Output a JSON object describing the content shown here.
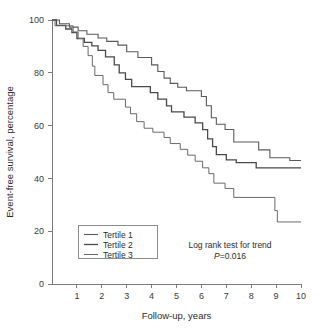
{
  "chart_data": {
    "type": "line",
    "subtype": "kaplan-meier-step",
    "title": "",
    "xlabel": "Follow-up, years",
    "ylabel": "Event-free survival, percentage",
    "xlim": [
      0,
      10
    ],
    "ylim": [
      0,
      100
    ],
    "xticks": [
      1,
      2,
      3,
      4,
      5,
      6,
      7,
      8,
      9,
      10
    ],
    "xtick_labels": [
      "1",
      "2",
      "3",
      "4",
      "5",
      "6",
      "7",
      "8",
      "9",
      "10"
    ],
    "yticks": [
      0,
      20,
      40,
      60,
      80,
      100
    ],
    "ytick_labels": [
      "0",
      "20",
      "40",
      "60",
      "80",
      "100"
    ],
    "grid": false,
    "legend_position": "lower-left",
    "annotations": [
      {
        "name": "log-rank-line1",
        "text": "Log rank test for trend"
      },
      {
        "name": "log-rank-line2",
        "text_prefix": "P",
        "text_suffix": "=0.016",
        "text": "P=0.016"
      }
    ],
    "series": [
      {
        "name": "Tertile 1",
        "color": "#5a5a5a",
        "width": 1.1,
        "final_value": 46.8,
        "points": [
          [
            0.0,
            100.0
          ],
          [
            0.3,
            100.0
          ],
          [
            0.3,
            98.6
          ],
          [
            0.7,
            98.6
          ],
          [
            0.7,
            97.3
          ],
          [
            1.05,
            97.3
          ],
          [
            1.05,
            95.9
          ],
          [
            1.4,
            95.9
          ],
          [
            1.4,
            94.6
          ],
          [
            1.85,
            94.6
          ],
          [
            1.85,
            93.2
          ],
          [
            2.2,
            93.2
          ],
          [
            2.2,
            91.9
          ],
          [
            2.65,
            91.9
          ],
          [
            2.65,
            90.5
          ],
          [
            3.0,
            90.5
          ],
          [
            3.0,
            88.0
          ],
          [
            3.45,
            88.0
          ],
          [
            3.45,
            85.8
          ],
          [
            4.0,
            85.8
          ],
          [
            4.0,
            83.0
          ],
          [
            4.25,
            83.0
          ],
          [
            4.25,
            80.5
          ],
          [
            4.5,
            80.5
          ],
          [
            4.5,
            78.0
          ],
          [
            4.75,
            78.0
          ],
          [
            4.75,
            76.0
          ],
          [
            5.05,
            76.0
          ],
          [
            5.05,
            74.5
          ],
          [
            5.4,
            74.5
          ],
          [
            5.4,
            73.2
          ],
          [
            6.0,
            73.2
          ],
          [
            6.0,
            71.0
          ],
          [
            6.2,
            71.0
          ],
          [
            6.2,
            67.5
          ],
          [
            6.4,
            67.5
          ],
          [
            6.4,
            63.0
          ],
          [
            6.6,
            63.0
          ],
          [
            6.6,
            60.5
          ],
          [
            6.95,
            60.5
          ],
          [
            6.95,
            58.5
          ],
          [
            7.3,
            58.5
          ],
          [
            7.3,
            53.8
          ],
          [
            8.3,
            53.8
          ],
          [
            8.3,
            50.8
          ],
          [
            8.75,
            50.8
          ],
          [
            8.75,
            47.8
          ],
          [
            9.55,
            47.8
          ],
          [
            9.55,
            46.8
          ],
          [
            10.0,
            46.8
          ]
        ]
      },
      {
        "name": "Tertile 2",
        "color": "#4a4a4a",
        "width": 1.3,
        "final_value": 44.0,
        "points": [
          [
            0.0,
            100.0
          ],
          [
            0.18,
            100.0
          ],
          [
            0.18,
            98.0
          ],
          [
            0.55,
            98.0
          ],
          [
            0.55,
            96.6
          ],
          [
            0.8,
            96.6
          ],
          [
            0.8,
            95.2
          ],
          [
            1.0,
            95.2
          ],
          [
            1.0,
            93.0
          ],
          [
            1.3,
            93.0
          ],
          [
            1.3,
            91.5
          ],
          [
            1.6,
            91.5
          ],
          [
            1.6,
            90.2
          ],
          [
            1.85,
            90.2
          ],
          [
            1.85,
            88.5
          ],
          [
            2.15,
            88.5
          ],
          [
            2.15,
            86.0
          ],
          [
            2.5,
            86.0
          ],
          [
            2.5,
            83.0
          ],
          [
            2.7,
            83.0
          ],
          [
            2.7,
            80.0
          ],
          [
            2.95,
            80.0
          ],
          [
            2.95,
            77.5
          ],
          [
            3.2,
            77.5
          ],
          [
            3.2,
            74.8
          ],
          [
            3.95,
            74.8
          ],
          [
            3.95,
            72.5
          ],
          [
            4.25,
            72.5
          ],
          [
            4.25,
            70.0
          ],
          [
            4.6,
            70.0
          ],
          [
            4.6,
            67.5
          ],
          [
            4.8,
            67.5
          ],
          [
            4.8,
            65.2
          ],
          [
            5.3,
            65.2
          ],
          [
            5.3,
            63.2
          ],
          [
            5.75,
            63.2
          ],
          [
            5.75,
            61.0
          ],
          [
            6.05,
            61.0
          ],
          [
            6.05,
            58.5
          ],
          [
            6.25,
            58.5
          ],
          [
            6.25,
            55.0
          ],
          [
            6.45,
            55.0
          ],
          [
            6.45,
            52.0
          ],
          [
            6.6,
            52.0
          ],
          [
            6.6,
            49.0
          ],
          [
            7.0,
            49.0
          ],
          [
            7.0,
            47.0
          ],
          [
            7.4,
            47.0
          ],
          [
            7.4,
            46.0
          ],
          [
            8.2,
            46.0
          ],
          [
            8.2,
            44.0
          ],
          [
            10.0,
            44.0
          ]
        ]
      },
      {
        "name": "Tertile 3",
        "color": "#6a6a6a",
        "width": 1.0,
        "final_value": 23.5,
        "points": [
          [
            0.0,
            100.0
          ],
          [
            0.12,
            100.0
          ],
          [
            0.12,
            97.8
          ],
          [
            0.85,
            97.8
          ],
          [
            0.85,
            95.5
          ],
          [
            1.05,
            95.5
          ],
          [
            1.05,
            93.0
          ],
          [
            1.25,
            93.0
          ],
          [
            1.25,
            90.0
          ],
          [
            1.45,
            90.0
          ],
          [
            1.45,
            86.5
          ],
          [
            1.62,
            86.5
          ],
          [
            1.62,
            82.5
          ],
          [
            1.72,
            82.5
          ],
          [
            1.72,
            79.0
          ],
          [
            2.05,
            79.0
          ],
          [
            2.05,
            75.5
          ],
          [
            2.25,
            75.5
          ],
          [
            2.25,
            72.5
          ],
          [
            2.48,
            72.5
          ],
          [
            2.48,
            70.0
          ],
          [
            2.95,
            70.0
          ],
          [
            2.95,
            67.0
          ],
          [
            3.15,
            67.0
          ],
          [
            3.15,
            64.5
          ],
          [
            3.4,
            64.5
          ],
          [
            3.4,
            61.5
          ],
          [
            3.7,
            61.5
          ],
          [
            3.7,
            59.0
          ],
          [
            4.05,
            59.0
          ],
          [
            4.05,
            57.5
          ],
          [
            4.5,
            57.5
          ],
          [
            4.5,
            55.5
          ],
          [
            4.75,
            55.5
          ],
          [
            4.75,
            53.2
          ],
          [
            5.15,
            53.2
          ],
          [
            5.15,
            51.0
          ],
          [
            5.45,
            51.0
          ],
          [
            5.45,
            48.8
          ],
          [
            5.75,
            48.8
          ],
          [
            5.75,
            46.5
          ],
          [
            6.05,
            46.5
          ],
          [
            6.05,
            44.0
          ],
          [
            6.3,
            44.0
          ],
          [
            6.3,
            41.8
          ],
          [
            6.5,
            41.8
          ],
          [
            6.5,
            38.2
          ],
          [
            6.95,
            38.2
          ],
          [
            6.95,
            36.2
          ],
          [
            7.3,
            36.2
          ],
          [
            7.3,
            32.8
          ],
          [
            8.95,
            32.8
          ],
          [
            8.95,
            27.8
          ],
          [
            9.05,
            27.8
          ],
          [
            9.05,
            23.5
          ],
          [
            10.0,
            23.5
          ]
        ]
      }
    ]
  },
  "legend": {
    "items": [
      {
        "label": "Tertile 1"
      },
      {
        "label": "Tertile 2"
      },
      {
        "label": "Tertile 3"
      }
    ]
  }
}
